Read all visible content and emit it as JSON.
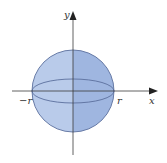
{
  "diagram": {
    "labels": {
      "y_axis": "y",
      "x_axis": "x",
      "neg_r": "−r",
      "pos_r": "r"
    },
    "colors": {
      "left_fill": "#b9cbea",
      "right_fill": "#9fb6e0",
      "outline": "#5b6f9d",
      "axis": "#3a3a3a"
    }
  }
}
